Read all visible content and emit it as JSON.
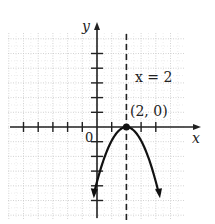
{
  "chart_data": {
    "type": "line",
    "title": "",
    "xlabel": "x",
    "ylabel": "y",
    "origin_label": "0",
    "xlim": [
      -6,
      6
    ],
    "ylim": [
      -6,
      6
    ],
    "grid": true,
    "axis_of_symmetry": {
      "x": 2,
      "label": "x = 2",
      "style": "dashed"
    },
    "vertex": {
      "x": 2,
      "y": 0,
      "label": "(2, 0)"
    },
    "curve": {
      "equation": "y = -(x - 2)^2",
      "opens": "down",
      "x": [
        0,
        0.5,
        1,
        1.5,
        2,
        2.5,
        3,
        3.5,
        4
      ],
      "y": [
        -4,
        -2.25,
        -1,
        -0.25,
        0,
        -0.25,
        -1,
        -2.25,
        -4
      ],
      "arrows_at_ends": true
    },
    "x_ticks": [
      -5,
      -4,
      -3,
      -2,
      -1,
      1,
      3,
      4
    ],
    "y_ticks": [
      -5,
      -4,
      -3,
      -2,
      -1,
      1,
      2,
      3,
      4,
      5
    ]
  },
  "colors": {
    "axis": "#222222",
    "curve": "#111111",
    "grid": "#c8c8c8",
    "background": "#ffffff"
  }
}
